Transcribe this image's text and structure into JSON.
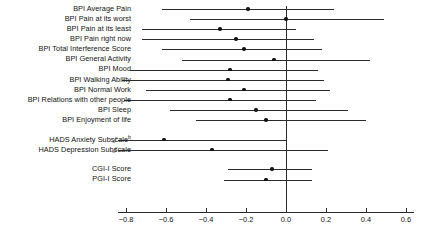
{
  "chart_data": {
    "type": "scatter",
    "title": "",
    "subtitle": "",
    "xlabel": "",
    "ylabel": "",
    "xlim": [
      -0.84,
      0.64
    ],
    "xticks": [
      -0.8,
      -0.6,
      -0.4,
      -0.2,
      0.0,
      0.2,
      0.4,
      0.6
    ],
    "xticklabels": [
      "−0.8",
      "−0.6",
      "−0.4",
      "−0.2",
      "0.0",
      "0.2",
      "0.4",
      "0.6"
    ],
    "grid": false,
    "legend": "none",
    "reference_line": 0.0,
    "marker": "filled-circle",
    "error_bar_style": "horizontal-95ci",
    "axis_break_symbol": "//",
    "groups": [
      {
        "name": "BPI",
        "rows": [
          {
            "label": "BPI Average Pain",
            "superscript": "",
            "estimate": -0.19,
            "ci_low": -0.62,
            "ci_high": 0.24,
            "axis_break": false
          },
          {
            "label": "BPI Pain at its worst",
            "superscript": "",
            "estimate": 0.0,
            "ci_low": -0.48,
            "ci_high": 0.49,
            "axis_break": false
          },
          {
            "label": "BPI Pain at its least",
            "superscript": "",
            "estimate": -0.33,
            "ci_low": -0.72,
            "ci_high": 0.05,
            "axis_break": false
          },
          {
            "label": "BPI Pain right now",
            "superscript": "",
            "estimate": -0.25,
            "ci_low": -0.72,
            "ci_high": 0.14,
            "axis_break": false
          },
          {
            "label": "BPI Total Interference Score",
            "superscript": "",
            "estimate": -0.21,
            "ci_low": -0.62,
            "ci_high": 0.18,
            "axis_break": false
          },
          {
            "label": "BPI General Activity",
            "superscript": "",
            "estimate": -0.06,
            "ci_low": -0.52,
            "ci_high": 0.42,
            "axis_high": 0.42,
            "axis_break": false
          },
          {
            "label": "BPI Mood",
            "superscript": "",
            "estimate": -0.28,
            "ci_low": -0.78,
            "ci_high": 0.16,
            "axis_break": false
          },
          {
            "label": "BPI Walking Ability",
            "superscript": "",
            "estimate": -0.29,
            "ci_low": -0.82,
            "ci_high": 0.19,
            "axis_break": false
          },
          {
            "label": "BPI Normal Work",
            "superscript": "",
            "estimate": -0.21,
            "ci_low": -0.7,
            "ci_high": 0.22,
            "axis_break": false
          },
          {
            "label": "BPI Relations with other people",
            "superscript": "",
            "estimate": -0.28,
            "ci_low": -0.81,
            "ci_high": 0.15,
            "axis_break": false
          },
          {
            "label": "BPI Sleep",
            "superscript": "",
            "estimate": -0.15,
            "ci_low": -0.58,
            "ci_high": 0.31,
            "axis_break": false
          },
          {
            "label": "BPI Enjoyment of life",
            "superscript": "",
            "estimate": -0.1,
            "ci_low": -0.45,
            "ci_high": 0.4,
            "axis_break": false
          }
        ]
      },
      {
        "name": "HADS",
        "rows": [
          {
            "label": "HADS Anxiety Subscale",
            "superscript": "b",
            "estimate": -0.61,
            "ci_low": -0.84,
            "ci_high": 0.0,
            "axis_break": true
          },
          {
            "label": "HADS Depression Subscale",
            "superscript": "",
            "estimate": -0.37,
            "ci_low": -0.84,
            "ci_high": 0.21,
            "axis_break": true
          }
        ]
      },
      {
        "name": "Global",
        "rows": [
          {
            "label": "CGI-I Score",
            "superscript": "",
            "estimate": -0.07,
            "ci_low": -0.29,
            "ci_high": 0.13,
            "axis_break": false
          },
          {
            "label": "PGI-I Score",
            "superscript": "",
            "estimate": -0.1,
            "ci_low": -0.31,
            "ci_high": 0.13,
            "axis_break": false
          }
        ]
      }
    ],
    "colors": {
      "marker": "#111111",
      "line": "#2b2b2b",
      "reference": "#2b2b2b",
      "text": "#111111",
      "background": "#ffffff"
    }
  }
}
